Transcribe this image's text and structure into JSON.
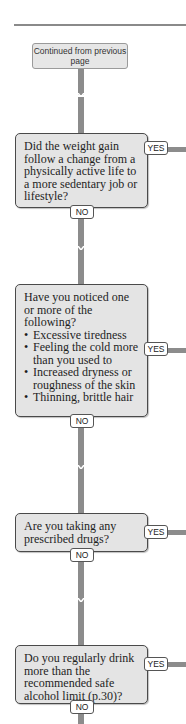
{
  "header": {
    "continued_label": "Continued from previous page"
  },
  "flowchart": {
    "nodes": [
      {
        "id": "q1",
        "question": "Did the weight gain follow a change from a physically active life to a more sedentary job or lifestyle?",
        "bullets": [],
        "yes_label": "YES",
        "no_label": "NO"
      },
      {
        "id": "q2",
        "question": "Have you noticed one or more of the following?",
        "bullets": [
          "Excessive tiredness",
          "Feeling the cold more than you used to",
          "Increased dryness or roughness of the skin",
          "Thinning, brittle hair"
        ],
        "yes_label": "YES",
        "no_label": "NO"
      },
      {
        "id": "q3",
        "question": "Are you taking any prescribed drugs?",
        "bullets": [],
        "yes_label": "YES",
        "no_label": "NO"
      },
      {
        "id": "q4",
        "question": "Do you regularly drink more than the recommended safe alcohol limit (p.30)?",
        "bullets": [],
        "yes_label": "YES",
        "no_label": "NO"
      }
    ]
  },
  "colors": {
    "connector": "#8c8c8c",
    "box_fill": "#e4e4e4",
    "box_border": "#4a4a4a",
    "badge_fill": "#ffffff"
  }
}
